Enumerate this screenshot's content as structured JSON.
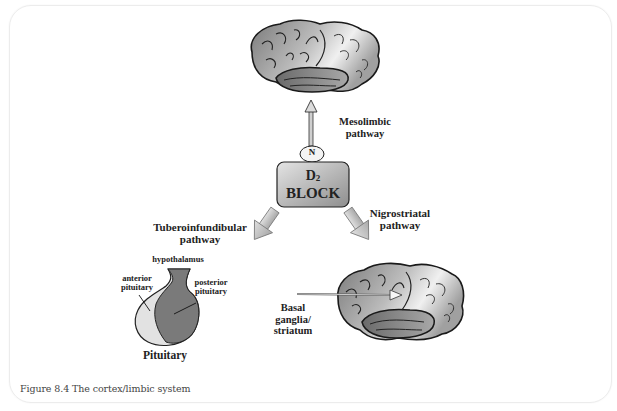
{
  "figure": {
    "caption": "Figure 8.4 The cortex/limbic system"
  },
  "center_block": {
    "subscript_label": "D2",
    "label_line1": "D",
    "label_sub": "2",
    "label_line2": "BLOCK",
    "node_label": "N"
  },
  "pathways": {
    "mesolimbic": {
      "line1": "Mesolimbic",
      "line2": "pathway"
    },
    "tuberoinfundibular": {
      "line1": "Tuberoinfundibular",
      "line2": "pathway"
    },
    "nigrostriatal": {
      "line1": "Nigrostriatal",
      "line2": "pathway"
    }
  },
  "pituitary": {
    "hypothalamus": "hypothalamus",
    "anterior_line1": "anterior",
    "anterior_line2": "pituitary",
    "posterior_line1": "posterior",
    "posterior_line2": "pituitary",
    "title": "Pituitary"
  },
  "basal_ganglia": {
    "line1": "Basal",
    "line2": "ganglia/",
    "line3": "striatum"
  },
  "colors": {
    "block_fill": "#bdbdbd",
    "arrow_fill": "#c8c8c8",
    "brain_dark": "#6e6e6e",
    "brain_light": "#e6e6e6",
    "posterior_fill": "#7a7a7a",
    "anterior_fill": "#e2e2e2"
  }
}
